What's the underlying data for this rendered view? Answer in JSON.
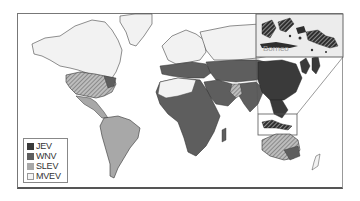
{
  "map": {
    "type": "world-distribution-map",
    "colors": {
      "JEV": "#3a3a3a",
      "WNV": "#5e5e5e",
      "SLEV": "#a8a8a8",
      "MVEV": "#f4f4f4",
      "land": "#f2f2f2",
      "border": "#333333"
    }
  },
  "legend": {
    "items": [
      {
        "label": "JEV",
        "color": "#3a3a3a"
      },
      {
        "label": "WNV",
        "color": "#5e5e5e"
      },
      {
        "label": "SLEV",
        "color": "#a8a8a8"
      },
      {
        "label": "MVEV",
        "color": "#f4f4f4"
      }
    ]
  },
  "inset": {
    "label": "Borneo"
  }
}
